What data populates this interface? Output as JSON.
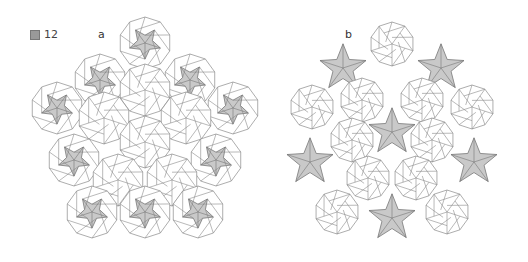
{
  "figure": {
    "number_label": "12",
    "number_icon": "figure-kanji-icon",
    "panels": [
      {
        "id": "a",
        "label": "a"
      },
      {
        "id": "b",
        "label": "b"
      }
    ]
  },
  "colors": {
    "stroke": "#8a8a8a",
    "fill_shaded": "#c9c9c9",
    "fill_white": "#ffffff"
  },
  "tiling_a": {
    "radius": 26,
    "decagons": [
      [
        145,
        43,
        true
      ],
      [
        100,
        80,
        true
      ],
      [
        190,
        80,
        true
      ],
      [
        57,
        108,
        true
      ],
      [
        233,
        108,
        true
      ],
      [
        145,
        90,
        false
      ],
      [
        104,
        118,
        false
      ],
      [
        186,
        118,
        false
      ],
      [
        145,
        142,
        false
      ],
      [
        74,
        160,
        true
      ],
      [
        216,
        160,
        true
      ],
      [
        118,
        180,
        false
      ],
      [
        172,
        180,
        false
      ],
      [
        92,
        212,
        true
      ],
      [
        145,
        212,
        true
      ],
      [
        198,
        212,
        true
      ]
    ]
  },
  "tiling_b": {
    "radius": 22,
    "decagons": [
      [
        392,
        44,
        false
      ],
      [
        343,
        68,
        "star"
      ],
      [
        441,
        68,
        "star"
      ],
      [
        312,
        107,
        false
      ],
      [
        472,
        107,
        false
      ],
      [
        362,
        100,
        false
      ],
      [
        422,
        100,
        false
      ],
      [
        392,
        132,
        "star"
      ],
      [
        352,
        140,
        false
      ],
      [
        432,
        140,
        false
      ],
      [
        310,
        162,
        "star"
      ],
      [
        474,
        162,
        "star"
      ],
      [
        368,
        178,
        false
      ],
      [
        416,
        178,
        false
      ],
      [
        337,
        212,
        false
      ],
      [
        447,
        212,
        false
      ],
      [
        392,
        218,
        "star"
      ]
    ]
  }
}
